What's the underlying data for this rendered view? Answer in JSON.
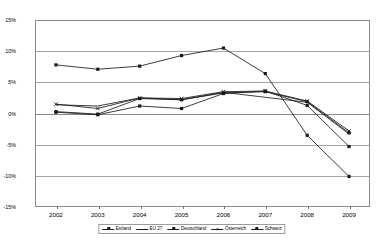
{
  "chart_data": {
    "type": "line",
    "title": "",
    "subtitle": "",
    "xlabel": "",
    "ylabel": "",
    "categories": [
      "2002",
      "2003",
      "2004",
      "2005",
      "2006",
      "2007",
      "2008",
      "2009"
    ],
    "ylim": [
      -15,
      15
    ],
    "ytick_labels": [
      "15%",
      "10%",
      "5%",
      "0%",
      "-5%",
      "-10%",
      "-15%"
    ],
    "ytick_values": [
      15,
      10,
      5,
      0,
      -5,
      -10,
      -15
    ],
    "grid": true,
    "legend_position": "bottom",
    "value_suffix": "%",
    "series": [
      {
        "name": "Estland",
        "marker": "square",
        "values": [
          7.8,
          7.1,
          7.6,
          9.3,
          10.5,
          6.4,
          -3.5,
          -10.1
        ]
      },
      {
        "name": "EU 27",
        "marker": "none",
        "values": [
          1.4,
          1.2,
          2.5,
          2.2,
          3.4,
          2.6,
          1.8,
          -3.3
        ]
      },
      {
        "name": "Deutschland",
        "marker": "square",
        "values": [
          0.2,
          -0.2,
          1.2,
          0.8,
          3.2,
          3.6,
          1.3,
          -5.3
        ]
      },
      {
        "name": "Österreich",
        "marker": "x",
        "values": [
          1.5,
          0.8,
          2.5,
          2.4,
          3.5,
          3.6,
          2.0,
          -2.8
        ]
      },
      {
        "name": "Schweiz",
        "marker": "square",
        "values": [
          0.3,
          -0.1,
          2.4,
          2.2,
          3.3,
          3.5,
          1.9,
          -3.1
        ]
      }
    ]
  }
}
